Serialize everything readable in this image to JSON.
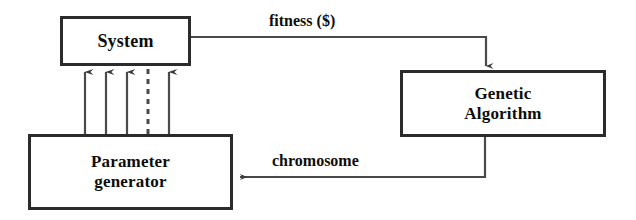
{
  "diagram": {
    "background_color": "#ffffff",
    "line_color": "#2b2b2b",
    "text_color": "#0d0d0d",
    "nodes": [
      {
        "id": "system",
        "label": "System",
        "lines": [
          "System"
        ]
      },
      {
        "id": "genetic-algorithm",
        "label": "Genetic Algorithm",
        "lines": [
          "Genetic",
          "Algorithm"
        ],
        "line1": "Genetic",
        "line2": "Algorithm"
      },
      {
        "id": "parameter-generator",
        "label": "Parameter generator",
        "lines": [
          "Parameter",
          "generator"
        ],
        "line1": "Parameter",
        "line2": "generator"
      }
    ],
    "edges": [
      {
        "id": "fitness",
        "label": "fitness ($)",
        "from": "system",
        "to": "genetic-algorithm",
        "style": "solid"
      },
      {
        "id": "chromosome",
        "label": "chromosome",
        "from": "genetic-algorithm",
        "to": "parameter-generator",
        "style": "solid"
      },
      {
        "id": "parameters",
        "label": "",
        "from": "parameter-generator",
        "to": "system",
        "style": "multiple-arrows",
        "arrow_count": 4,
        "dashed_count": 1
      }
    ]
  }
}
